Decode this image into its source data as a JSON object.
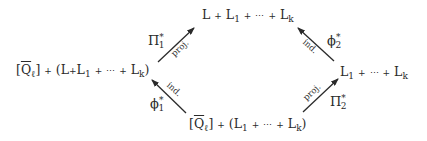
{
  "diagram": {
    "type": "commutative-diagram",
    "nodes": {
      "top": {
        "text": "L + L₁ + ⋯ + L_k",
        "parts": [
          "L",
          "L",
          "1",
          "L",
          "k"
        ]
      },
      "left": {
        "text": "[Q̄_ℓ] + (L + L₁ + ⋯ + L_k)",
        "q": "Q",
        "ell": "ℓ",
        "parts": [
          "L",
          "L",
          "1",
          "L",
          "k"
        ]
      },
      "right": {
        "text": "L₁ + ⋯ + L_k",
        "parts": [
          "L",
          "1",
          "L",
          "k"
        ]
      },
      "bottom": {
        "text": "[Q̄_ℓ] + (L₁ + ⋯ + L_k)",
        "q": "Q",
        "ell": "ℓ",
        "parts": [
          "L",
          "1",
          "L",
          "k"
        ]
      }
    },
    "edges": [
      {
        "id": "pi1",
        "from": "left",
        "to": "top",
        "label": "Π",
        "sub": "1",
        "sup": "*",
        "tag": "proj."
      },
      {
        "id": "phi1",
        "from": "bottom",
        "to": "left",
        "label": "ϕ",
        "sub": "1",
        "sup": "*",
        "tag": "ind."
      },
      {
        "id": "phi2",
        "from": "right",
        "to": "top",
        "label": "ϕ",
        "sub": "2",
        "sup": "*",
        "tag": "ind."
      },
      {
        "id": "pi2",
        "from": "bottom",
        "to": "right",
        "label": "Π",
        "sub": "2",
        "sup": "*",
        "tag": "proj."
      }
    ],
    "symbols": {
      "plus": "+",
      "dots": "⋯",
      "lbr": "[",
      "rbr": "]",
      "lpar": "(",
      "rpar": ")"
    }
  }
}
